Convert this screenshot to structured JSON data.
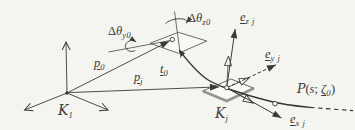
{
  "figure": {
    "type": "beam-kinematics-diagram",
    "colors": {
      "background": "#f4f4f0",
      "line": "#3a3a3a",
      "construction_line": "#5a5a5a",
      "plate_thick_edge": "#949494",
      "plate_face": "#f8f8f5"
    },
    "labels": {
      "frame_origin": {
        "base": "K",
        "sub": "1"
      },
      "frame_j": {
        "base": "K",
        "sub": "j"
      },
      "p0": {
        "base": "p",
        "sub": "0"
      },
      "pj": {
        "base": "p",
        "sub": "j"
      },
      "t0": {
        "base": "t",
        "sub": "0"
      },
      "e_zj": {
        "base": "e",
        "sub": "z j"
      },
      "e_yj": {
        "base": "e",
        "sub": "y j"
      },
      "e_xj": {
        "base": "e",
        "sub": "x j"
      },
      "delta_theta_y0": {
        "delta": "Δ",
        "theta": "θ",
        "sub": "y0"
      },
      "delta_theta_z0": {
        "delta": "Δ",
        "theta": "θ",
        "sub": "z0"
      },
      "curve_function": {
        "fn": "P",
        "open": "(",
        "arg": "s",
        "sep": "; ",
        "zeta": "ζ",
        "zeta_sub": "0",
        "close": ")"
      }
    }
  }
}
